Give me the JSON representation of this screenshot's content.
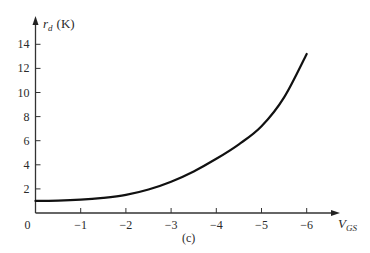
{
  "chart_data": {
    "type": "line",
    "title": "",
    "caption": "(c)",
    "xlabel": "V_GS",
    "xlabel_main": "V",
    "xlabel_sub": "GS",
    "ylabel": "r_d (K)",
    "ylabel_main": "r",
    "ylabel_sub": "d",
    "ylabel_unit": "(K)",
    "x_ticks": [
      0,
      -1,
      -2,
      -3,
      -4,
      -5,
      -6
    ],
    "x_tick_labels": [
      "0",
      "−1",
      "−2",
      "−3",
      "−4",
      "−5",
      "−6"
    ],
    "y_ticks": [
      2,
      4,
      6,
      8,
      10,
      12,
      14
    ],
    "y_tick_labels": [
      "2",
      "4",
      "6",
      "8",
      "10",
      "12",
      "14"
    ],
    "xlim": [
      0,
      -6.7
    ],
    "ylim": [
      0,
      16
    ],
    "grid": false,
    "legend": null,
    "series": [
      {
        "name": "r_d vs V_GS",
        "x": [
          0,
          -0.5,
          -1,
          -1.5,
          -2,
          -2.5,
          -3,
          -3.5,
          -4,
          -4.5,
          -5,
          -5.5,
          -6
        ],
        "y": [
          1.0,
          1.02,
          1.1,
          1.25,
          1.5,
          1.95,
          2.6,
          3.45,
          4.5,
          5.7,
          7.2,
          9.6,
          13.2
        ]
      }
    ]
  }
}
